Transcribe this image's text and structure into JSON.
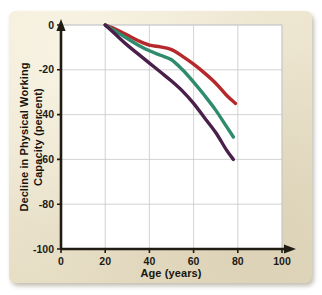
{
  "card": {
    "background_color": "#ece3ca"
  },
  "chart_data": {
    "type": "line",
    "title": "",
    "xlabel": "Age (years)",
    "ylabel": "Decline in Physical Working Capacity (percent)",
    "ylabel_line1": "Decline in Physical Working",
    "ylabel_line2": "Capacity (percent)",
    "xlim": [
      0,
      100
    ],
    "ylim": [
      -100,
      0
    ],
    "xticks": [
      0,
      20,
      40,
      60,
      80,
      100
    ],
    "yticks": [
      0,
      -20,
      -40,
      -60,
      -80,
      -100
    ],
    "xtick_labels": [
      "0",
      "20",
      "40",
      "60",
      "80",
      "100"
    ],
    "ytick_labels": [
      "0",
      "-20",
      "-40",
      "-60",
      "-80",
      "-100"
    ],
    "grid": true,
    "legend": "none",
    "plot_background": "#ffffff",
    "grid_color": "#c8c8cc",
    "axis_color": "#211c13",
    "x_axis_arrow": true,
    "y_axis_arrow": true,
    "series": [
      {
        "name": "upper-curve",
        "color": "#b5282b",
        "x": [
          20,
          25,
          30,
          35,
          40,
          45,
          50,
          55,
          60,
          65,
          70,
          75,
          79
        ],
        "values": [
          0,
          -2.0,
          -4.5,
          -7.0,
          -9.0,
          -9.8,
          -11.0,
          -14.0,
          -17.5,
          -21.5,
          -26.0,
          -31.5,
          -35.0
        ]
      },
      {
        "name": "middle-curve",
        "color": "#2e8b6e",
        "x": [
          20,
          25,
          30,
          35,
          40,
          45,
          50,
          55,
          60,
          65,
          70,
          75,
          78
        ],
        "values": [
          0,
          -3.0,
          -6.0,
          -9.0,
          -11.5,
          -13.5,
          -15.5,
          -20.0,
          -25.5,
          -31.5,
          -38.0,
          -45.5,
          -50.0
        ]
      },
      {
        "name": "lower-curve",
        "color": "#4a1f4a",
        "x": [
          20,
          25,
          30,
          35,
          40,
          45,
          50,
          55,
          60,
          65,
          70,
          75,
          78
        ],
        "values": [
          0,
          -4.5,
          -9.0,
          -13.0,
          -17.0,
          -21.0,
          -25.0,
          -29.5,
          -35.0,
          -41.5,
          -48.0,
          -56.0,
          -60.0
        ]
      }
    ]
  }
}
